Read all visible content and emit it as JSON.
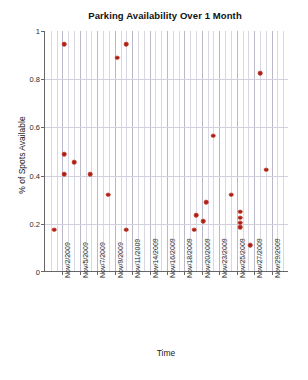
{
  "chart_data": {
    "type": "scatter",
    "title": "Parking Availability Over 1 Month",
    "xlabel": "Time",
    "ylabel": "% of Spots Available",
    "grid": true,
    "legend": "none",
    "marker_color": "#a32015",
    "ylim": [
      0,
      1
    ],
    "yticks": [
      "0",
      "0.2",
      "0.4",
      "0.6",
      "0.8",
      "1"
    ],
    "ytick_values": [
      0,
      0.2,
      0.4,
      0.6,
      0.8,
      1
    ],
    "xtick_labels": [
      "Nov/2/2009",
      "Nov/5/2009",
      "Nov/7/2009",
      "Nov/9/2009",
      "Nov/11/2009",
      "Nov/14/2009",
      "Nov/16/2009",
      "Nov/18/2009",
      "Nov/20/2009",
      "Nov/23/2009",
      "Nov/25/2009",
      "Nov/27/2009",
      "Nov/29/2009"
    ],
    "points": [
      {
        "x": "Nov/2/2009",
        "x_frac": 0.037,
        "y": 0.175
      },
      {
        "x": "Nov/3/2009",
        "x_frac": 0.078,
        "y": 0.945
      },
      {
        "x": "Nov/4/2009",
        "x_frac": 0.078,
        "y": 0.49
      },
      {
        "x": "Nov/4/2009",
        "x_frac": 0.078,
        "y": 0.405
      },
      {
        "x": "Nov/5/2009",
        "x_frac": 0.119,
        "y": 0.455
      },
      {
        "x": "Nov/7/2009",
        "x_frac": 0.185,
        "y": 0.405
      },
      {
        "x": "Nov/9/2009",
        "x_frac": 0.295,
        "y": 0.89
      },
      {
        "x": "Nov/9/2009",
        "x_frac": 0.332,
        "y": 0.945
      },
      {
        "x": "Nov/8/2009",
        "x_frac": 0.258,
        "y": 0.32
      },
      {
        "x": "Nov/11/2009",
        "x_frac": 0.332,
        "y": 0.175
      },
      {
        "x": "Nov/19/2009",
        "x_frac": 0.611,
        "y": 0.175
      },
      {
        "x": "Nov/20/2009",
        "x_frac": 0.619,
        "y": 0.235
      },
      {
        "x": "Nov/20/2009",
        "x_frac": 0.648,
        "y": 0.21
      },
      {
        "x": "Nov/20/2009",
        "x_frac": 0.66,
        "y": 0.29
      },
      {
        "x": "Nov/22/2009",
        "x_frac": 0.689,
        "y": 0.565
      },
      {
        "x": "Nov/23/2009",
        "x_frac": 0.762,
        "y": 0.32
      },
      {
        "x": "Nov/24/2009",
        "x_frac": 0.799,
        "y": 0.25
      },
      {
        "x": "Nov/24/2009",
        "x_frac": 0.799,
        "y": 0.225
      },
      {
        "x": "Nov/24/2009",
        "x_frac": 0.799,
        "y": 0.205
      },
      {
        "x": "Nov/24/2009",
        "x_frac": 0.799,
        "y": 0.185
      },
      {
        "x": "Nov/26/2009",
        "x_frac": 0.84,
        "y": 0.11
      },
      {
        "x": "Nov/27/2009",
        "x_frac": 0.881,
        "y": 0.825
      },
      {
        "x": "Nov/28/2009",
        "x_frac": 0.906,
        "y": 0.425
      }
    ]
  }
}
